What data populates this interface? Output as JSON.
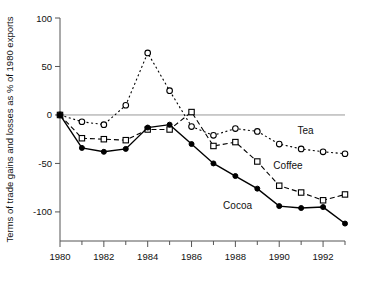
{
  "chart_data": {
    "type": "line",
    "title": "",
    "xlabel": "",
    "ylabel": "Terms of trade gains and losses as % of 1980 exports",
    "x": [
      1980,
      1981,
      1982,
      1983,
      1984,
      1985,
      1986,
      1987,
      1988,
      1989,
      1990,
      1991,
      1992,
      1993
    ],
    "xlim": [
      1980,
      1993
    ],
    "ylim": [
      -130,
      100
    ],
    "yticks": [
      100,
      50,
      0,
      -50,
      -100
    ],
    "yticklabels": [
      "100",
      "50",
      "0",
      "-50",
      "-100"
    ],
    "xticks": [
      1980,
      1982,
      1984,
      1986,
      1988,
      1990,
      1992
    ],
    "xticklabels": [
      "1980",
      "1982",
      "1984",
      "1986",
      "1988",
      "1990",
      "1992"
    ],
    "grid": false,
    "zero_line": true,
    "legend": "inline-annotations",
    "series": [
      {
        "name": "Tea",
        "marker": "open-circle",
        "linestyle": "dotted",
        "color": "#000000",
        "values": [
          0,
          -7,
          -10,
          10,
          64,
          25,
          -12,
          -21,
          -14,
          -17,
          -30,
          -35,
          -38,
          -40
        ]
      },
      {
        "name": "Coffee",
        "marker": "open-square",
        "linestyle": "dashed",
        "color": "#000000",
        "values": [
          0,
          -24,
          -25,
          -26,
          -15,
          -15,
          3,
          -32,
          -28,
          -48,
          -73,
          -80,
          -88,
          -82
        ]
      },
      {
        "name": "Cocoa",
        "marker": "filled-circle",
        "linestyle": "solid",
        "color": "#000000",
        "values": [
          0,
          -34,
          -38,
          -35,
          -13,
          -10,
          -30,
          -50,
          -63,
          -76,
          -94,
          -96,
          -95,
          -112
        ]
      }
    ],
    "annotations": [
      {
        "text": "Tea",
        "x": 1991.2,
        "y": -20
      },
      {
        "text": "Coffee",
        "x": 1990.4,
        "y": -56
      },
      {
        "text": "Cocoa",
        "x": 1988.1,
        "y": -97
      }
    ]
  }
}
